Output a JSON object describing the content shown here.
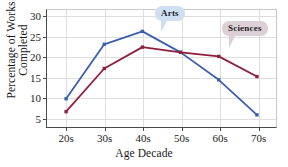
{
  "chart_data": {
    "type": "line",
    "title": "",
    "xlabel": "Age Decade",
    "ylabel_line1": "Percentage of Works",
    "ylabel_line2": "Completed",
    "categories": [
      "20s",
      "30s",
      "40s",
      "50s",
      "60s",
      "70s"
    ],
    "yticks": [
      "5",
      "10",
      "15",
      "20",
      "25",
      "30"
    ],
    "ylim": [
      2.5,
      31.5
    ],
    "grid": true,
    "legend_position": "inline-callouts",
    "series": [
      {
        "name": "Arts",
        "color": "#3b5fae",
        "values": [
          9.5,
          23.0,
          26.2,
          21.0,
          14.2,
          5.5
        ]
      },
      {
        "name": "Sciences",
        "color": "#8e1f3d",
        "values": [
          6.3,
          17.0,
          22.3,
          21.0,
          20.0,
          15.0
        ]
      }
    ],
    "annotations": [
      {
        "label": "Arts",
        "series": "Arts",
        "background": "#cfe0f2"
      },
      {
        "label": "Sciences",
        "series": "Sciences",
        "background": "#ddcfd6"
      }
    ]
  }
}
